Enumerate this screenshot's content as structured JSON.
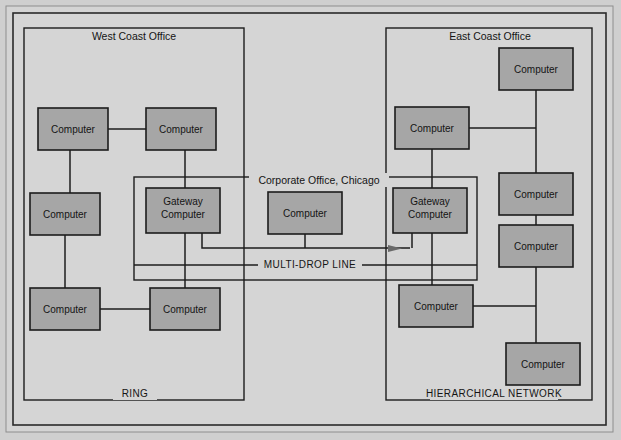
{
  "figure": {
    "background_color": "#d8d8d8",
    "node_fill_color": "#a6a6a6",
    "line_color": "#1c1c1c",
    "text_color": "#141414"
  },
  "groups": [
    {
      "id": "west-coast-office",
      "title": "West Coast Office",
      "caption": "RING",
      "x": 24,
      "y": 28,
      "w": 220,
      "h": 372
    },
    {
      "id": "corporate-office",
      "title": "Corporate Office, Chicago",
      "caption": "MULTI-DROP LINE",
      "x": 134,
      "y": 177,
      "w": 343,
      "h": 103
    },
    {
      "id": "east-coast-office",
      "title": "East Coast Office",
      "caption": "HIERARCHICAL NETWORK",
      "x": 386,
      "y": 28,
      "w": 206,
      "h": 372
    }
  ],
  "nodes": [
    {
      "id": "wc-n1",
      "label": "Computer",
      "x": 38,
      "y": 108,
      "w": 70,
      "h": 42,
      "group": "west-coast-office"
    },
    {
      "id": "wc-n2",
      "label": "Computer",
      "x": 146,
      "y": 108,
      "w": 70,
      "h": 42,
      "group": "west-coast-office"
    },
    {
      "id": "wc-n3",
      "label": "Computer",
      "x": 30,
      "y": 193,
      "w": 70,
      "h": 42,
      "group": "west-coast-office"
    },
    {
      "id": "wc-n4",
      "label": "Computer",
      "x": 30,
      "y": 288,
      "w": 70,
      "h": 42,
      "group": "west-coast-office"
    },
    {
      "id": "wc-n5",
      "label": "Computer",
      "x": 150,
      "y": 288,
      "w": 70,
      "h": 42,
      "group": "west-coast-office"
    },
    {
      "id": "gw-west",
      "label1": "Gateway",
      "label2": "Computer",
      "x": 146,
      "y": 188,
      "w": 74,
      "h": 45,
      "group": "corporate-office"
    },
    {
      "id": "corp-n1",
      "label": "Computer",
      "x": 268,
      "y": 192,
      "w": 74,
      "h": 42,
      "group": "corporate-office"
    },
    {
      "id": "gw-east",
      "label1": "Gateway",
      "label2": "Computer",
      "x": 393,
      "y": 188,
      "w": 74,
      "h": 45,
      "group": "corporate-office"
    },
    {
      "id": "ec-n1",
      "label": "Computer",
      "x": 499,
      "y": 48,
      "w": 74,
      "h": 42,
      "group": "east-coast-office"
    },
    {
      "id": "ec-n2",
      "label": "Computer",
      "x": 395,
      "y": 107,
      "w": 74,
      "h": 42,
      "group": "east-coast-office"
    },
    {
      "id": "ec-n3",
      "label": "Computer",
      "x": 499,
      "y": 173,
      "w": 74,
      "h": 42,
      "group": "east-coast-office"
    },
    {
      "id": "ec-n4",
      "label": "Computer",
      "x": 499,
      "y": 225,
      "w": 74,
      "h": 42,
      "group": "east-coast-office"
    },
    {
      "id": "ec-n5",
      "label": "Computer",
      "x": 399,
      "y": 285,
      "w": 74,
      "h": 42,
      "group": "east-coast-office"
    },
    {
      "id": "ec-n6",
      "label": "Computer",
      "x": 506,
      "y": 343,
      "w": 74,
      "h": 42,
      "group": "east-coast-office"
    }
  ],
  "labels": {
    "west_group_title": "West Coast Office",
    "east_group_title": "East Coast Office",
    "corporate_group_title": "Corporate Office, Chicago",
    "ring_caption": "RING",
    "hierarchical_caption": "HIERARCHICAL NETWORK",
    "multidrop_caption": "MULTI-DROP LINE"
  },
  "frame": {
    "outer_x": 6,
    "outer_y": 6,
    "outer_w": 607,
    "outer_h": 426,
    "inner_x": 14,
    "inner_y": 14,
    "inner_w": 592,
    "inner_h": 411
  }
}
